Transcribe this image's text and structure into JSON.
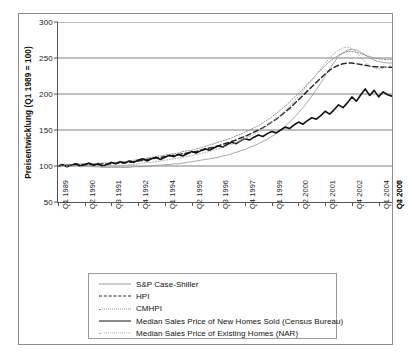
{
  "chart_data": {
    "type": "line",
    "title": "",
    "xlabel": "",
    "ylabel": "Preisentwicklung (Q1 1989 = 100)",
    "ylim": [
      50,
      300
    ],
    "yticks": [
      50,
      100,
      150,
      200,
      250,
      300
    ],
    "ytick_labels": [
      "50",
      "100",
      "150",
      "200",
      "250",
      "300"
    ],
    "grid": "horizontal",
    "legend_position": "below-plot",
    "x_tick_labels": [
      "Q1 1989",
      "Q2 1990",
      "Q3 1991",
      "Q4 1992",
      "Q1 1994",
      "Q2 1995",
      "Q3 1996",
      "Q4 1997",
      "Q1 1999",
      "Q2 2000",
      "Q3 2001",
      "Q4 2002",
      "Q1 2004",
      "Q2 2005",
      "Q3 2006",
      "Q4 2007"
    ],
    "x_tick_interval_quarters": 6,
    "x_range": [
      "Q1 1989",
      "Q4 2007"
    ],
    "n_points": 76,
    "series": [
      {
        "name": "S&P Case-Shiller",
        "style": "solid-thin",
        "color": "#9d9d9d",
        "values": [
          100,
          100,
          101,
          101,
          101,
          101,
          100,
          100,
          99,
          99,
          98,
          98,
          98,
          98,
          98,
          98,
          98,
          99,
          99,
          99,
          100,
          100,
          101,
          101,
          102,
          102,
          103,
          103,
          104,
          105,
          106,
          107,
          108,
          109,
          110,
          111,
          112,
          114,
          115,
          117,
          119,
          121,
          123,
          126,
          128,
          131,
          134,
          137,
          141,
          145,
          150,
          155,
          161,
          167,
          174,
          181,
          189,
          197,
          206,
          215,
          225,
          235,
          244,
          252,
          257,
          261,
          262,
          261,
          258,
          254,
          250,
          247,
          245,
          244,
          243,
          243
        ]
      },
      {
        "name": "HPI",
        "style": "dashed",
        "color": "#2a2a2a",
        "values": [
          100,
          101,
          101,
          102,
          102,
          102,
          102,
          102,
          102,
          102,
          103,
          103,
          103,
          104,
          104,
          105,
          105,
          106,
          107,
          108,
          109,
          110,
          111,
          112,
          113,
          114,
          115,
          116,
          117,
          118,
          119,
          120,
          122,
          123,
          125,
          126,
          128,
          130,
          132,
          134,
          136,
          139,
          141,
          144,
          147,
          150,
          153,
          157,
          161,
          165,
          170,
          175,
          180,
          186,
          192,
          198,
          204,
          210,
          216,
          222,
          228,
          233,
          237,
          240,
          242,
          243,
          243,
          242,
          241,
          240,
          239,
          238,
          238,
          237,
          237,
          237
        ]
      },
      {
        "name": "CMHPI",
        "style": "dotted-fine",
        "color": "#8f8f8f",
        "values": [
          100,
          101,
          102,
          102,
          103,
          103,
          103,
          103,
          103,
          104,
          104,
          104,
          105,
          105,
          106,
          106,
          107,
          108,
          109,
          110,
          111,
          112,
          113,
          114,
          115,
          116,
          117,
          118,
          120,
          121,
          122,
          124,
          125,
          127,
          129,
          131,
          133,
          135,
          137,
          139,
          142,
          144,
          147,
          150,
          153,
          156,
          160,
          164,
          168,
          173,
          178,
          183,
          189,
          195,
          201,
          207,
          214,
          220,
          227,
          233,
          239,
          245,
          250,
          254,
          257,
          259,
          259,
          258,
          256,
          254,
          252,
          250,
          249,
          248,
          248,
          248
        ]
      },
      {
        "name": "Median Sales Price of New Homes Sold (Census Bureau)",
        "style": "solid-thick",
        "color": "#111111",
        "values": [
          100,
          102,
          99,
          101,
          103,
          100,
          102,
          104,
          101,
          103,
          100,
          102,
          105,
          103,
          106,
          104,
          107,
          105,
          108,
          110,
          107,
          110,
          112,
          109,
          112,
          115,
          113,
          116,
          114,
          117,
          120,
          118,
          121,
          124,
          122,
          125,
          128,
          126,
          130,
          133,
          131,
          135,
          138,
          136,
          140,
          143,
          141,
          145,
          148,
          146,
          150,
          154,
          152,
          157,
          161,
          158,
          163,
          167,
          165,
          170,
          176,
          172,
          178,
          185,
          181,
          188,
          196,
          190,
          199,
          207,
          198,
          205,
          196,
          203,
          199,
          197
        ]
      },
      {
        "name": "Median Sales Price of Existing Homes (NAR)",
        "style": "dotted-light",
        "color": "#b0b0b0",
        "values": [
          100,
          100,
          100,
          100,
          100,
          99,
          99,
          99,
          99,
          99,
          99,
          100,
          100,
          100,
          101,
          101,
          102,
          102,
          103,
          104,
          105,
          105,
          106,
          107,
          108,
          109,
          110,
          111,
          112,
          113,
          114,
          116,
          117,
          119,
          120,
          122,
          124,
          126,
          128,
          130,
          133,
          135,
          138,
          141,
          144,
          148,
          152,
          156,
          161,
          166,
          171,
          177,
          183,
          190,
          197,
          204,
          212,
          219,
          227,
          235,
          243,
          250,
          256,
          261,
          264,
          265,
          263,
          258,
          251,
          244,
          239,
          236,
          235,
          236,
          238,
          240
        ]
      }
    ]
  },
  "legend": {
    "items": [
      {
        "label": "S&P Case-Shiller"
      },
      {
        "label": "HPI"
      },
      {
        "label": "CMHPI"
      },
      {
        "label": "Median Sales Price of New Homes Sold (Census Bureau)"
      },
      {
        "label": "Median Sales Price of Existing Homes (NAR)"
      }
    ]
  }
}
